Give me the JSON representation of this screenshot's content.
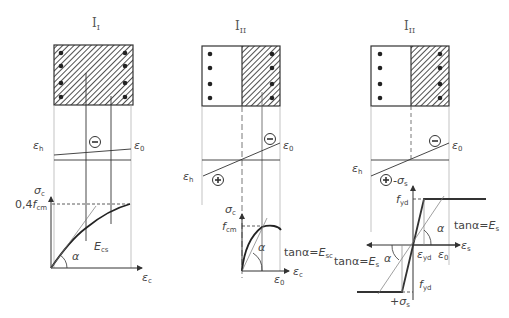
{
  "panels": [
    {
      "id": "stage-1",
      "title": "I",
      "title_sub": "I",
      "strain": {
        "top_label": "ε",
        "top_sub": "h",
        "bottom_label": "ε",
        "bottom_sub": "0",
        "compression_sign": "−"
      },
      "graph": {
        "y_axis": "σ",
        "y_sub": "c",
        "x_axis": "ε",
        "x_sub": "c",
        "level_label_pre": "0,4",
        "level_label_f": "f",
        "level_sub": "cm",
        "modulus": "E",
        "modulus_sub": "cs",
        "angle": "α"
      }
    },
    {
      "id": "stage-2-concrete",
      "title": "I",
      "title_sub": "II",
      "strain": {
        "top_label": "ε",
        "top_sub": "0",
        "bottom_label": "ε",
        "bottom_sub": "h",
        "compression_sign": "−",
        "tension_sign": "+"
      },
      "graph": {
        "y_axis": "σ",
        "y_sub": "c",
        "x_axis": "ε",
        "x_sub": "c",
        "level_label_f": "f",
        "level_sub": "cm",
        "angle": "α",
        "tan_label": "tanα=",
        "tan_E": "E",
        "tan_sub": "sc",
        "x_mark": "ε",
        "x_mark_sub": "0"
      }
    },
    {
      "id": "stage-2-steel",
      "title": "I",
      "title_sub": "II",
      "strain": {
        "top_label": "ε",
        "top_sub": "0",
        "bottom_label": "ε",
        "bottom_sub": "h",
        "compression_sign": "−",
        "tension_sign": "+",
        "tension_stress": "-σ",
        "tension_stress_sub": "s"
      },
      "graph": {
        "y_top": "f",
        "y_top_sub": "yd",
        "y_bottom": "f",
        "y_bottom_sub": "yd",
        "x_axis": "ε",
        "x_sub": "s",
        "x_mark1": "ε",
        "x_mark1_sub": "yd",
        "x_mark2": "ε",
        "x_mark2_sub": "0",
        "angle": "α",
        "tan_label": "tanα=",
        "tan_E": "E",
        "tan_sub": "s",
        "bottom_stress": "+σ",
        "bottom_stress_sub": "s"
      }
    }
  ],
  "colors": {
    "line": "#333333",
    "thin": "#888888",
    "hatch": "#222222",
    "text": "#444444"
  }
}
